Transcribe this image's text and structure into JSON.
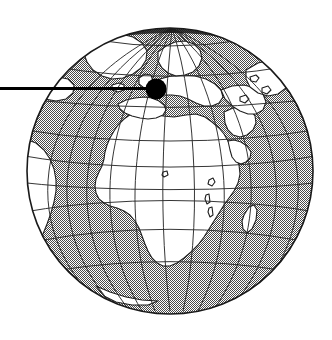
{
  "figure": {
    "background_color": "#ffffff",
    "ink_color": "#1a1a1a",
    "ocean_fill_color": "#9a9a9a",
    "land_fill_color": "#ffffff",
    "marker_color": "#000000",
    "graticule_color": "#2b2b2b"
  },
  "globe": {
    "name": "earth-globe",
    "projection": "orthographic",
    "center_x": 170,
    "center_y": 171,
    "radius": 143,
    "outline_width": 1.6,
    "center_longitude": 10,
    "center_latitude": 18,
    "graticule_step_degrees": 20,
    "visible_regions": [
      "Africa",
      "Europe",
      "Greenland",
      "Scandinavia",
      "Arabian Peninsula",
      "Madagascar",
      "Western Asia",
      "South America (eastern limb)",
      "North Atlantic Ocean",
      "Indian Ocean"
    ]
  },
  "marker": {
    "name": "location-marker",
    "shape": "filled-circle",
    "x": 156,
    "y": 89,
    "radius": 10.5,
    "label": ""
  },
  "leader_line": {
    "name": "callout-leader-line",
    "x1": 0,
    "y1": 88.5,
    "x2": 156,
    "y2": 88.5,
    "stroke_width": 3.2
  }
}
